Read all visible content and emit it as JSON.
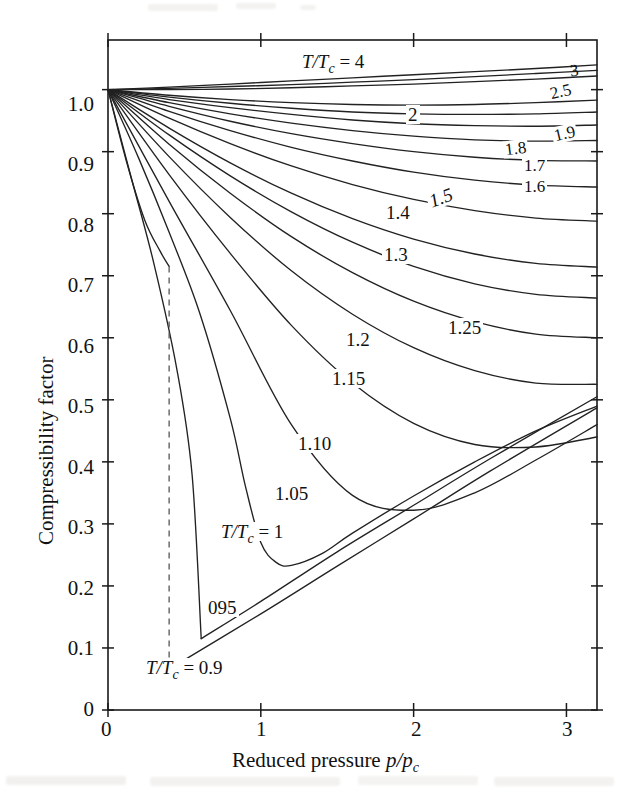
{
  "figure": {
    "kind": "generalized-compressibility-chart"
  },
  "axes": {
    "x": {
      "title_plain": "Reduced pressure ",
      "title_italic": "p/p",
      "title_sub": "c",
      "ticks": [
        "0",
        "1",
        "2",
        "3"
      ],
      "tick_values": [
        0,
        1,
        2,
        3
      ],
      "range": [
        0,
        3.2
      ]
    },
    "y": {
      "title": "Compressibility factor",
      "ticks": [
        "0",
        "0.1",
        "0.2",
        "0.3",
        "0.4",
        "0.5",
        "0.6",
        "0.7",
        "0.8",
        "0.9",
        "1.0"
      ],
      "tick_values": [
        0,
        0.1,
        0.2,
        0.3,
        0.4,
        0.5,
        0.6,
        0.7,
        0.8,
        0.9,
        1.0
      ],
      "range": [
        0,
        1.08
      ]
    }
  },
  "labels": {
    "tc4": {
      "plain_pre": "",
      "italic": "T/T",
      "sub": "c",
      "post": " = 4"
    },
    "tc1": {
      "italic": "T/T",
      "sub": "c",
      "post": " = 1"
    },
    "tc09": {
      "italic": "T/T",
      "sub": "c",
      "post": " = 0.9"
    },
    "tc095": "095",
    "c3": "3",
    "c25": "2.5",
    "c2": "2",
    "c19": "1.9",
    "c18": "1.8",
    "c17": "1.7",
    "c16": "1.6",
    "c15": "1.5",
    "c14": "1.4",
    "c13": "1.3",
    "c125": "1.25",
    "c12": "1.2",
    "c115": "1.15",
    "c110": "1.10",
    "c105": "1.05"
  },
  "colors": {
    "ink": "#1a1a1a",
    "curve": "#222222",
    "dashed": "#555555",
    "background": "#ffffff"
  },
  "chart_data": {
    "type": "line",
    "title": "",
    "xlabel": "Reduced pressure p/pc",
    "ylabel": "Compressibility factor",
    "xlim": [
      0,
      3.2
    ],
    "ylim": [
      0,
      1.08
    ],
    "grid": false,
    "legend": "inline-curve-labels",
    "x_ticks": [
      0,
      1,
      2,
      3
    ],
    "y_ticks": [
      0,
      0.1,
      0.2,
      0.3,
      0.4,
      0.5,
      0.6,
      0.7,
      0.8,
      0.9,
      1.0
    ],
    "series": [
      {
        "name": "T/Tc = 4",
        "label": "4",
        "x": [
          0,
          0.4,
          0.8,
          1.2,
          1.6,
          2.0,
          2.4,
          2.8,
          3.2
        ],
        "values": [
          1.0,
          1.004,
          1.009,
          1.014,
          1.019,
          1.024,
          1.029,
          1.034,
          1.04
        ]
      },
      {
        "name": "T/Tc = 3",
        "label": "3",
        "x": [
          0,
          0.4,
          0.8,
          1.2,
          1.6,
          2.0,
          2.4,
          2.8,
          3.2
        ],
        "values": [
          1.0,
          1.002,
          1.005,
          1.008,
          1.012,
          1.016,
          1.021,
          1.026,
          1.031
        ]
      },
      {
        "name": "T/Tc = 2.5",
        "label": "2.5",
        "x": [
          0,
          0.4,
          0.8,
          1.2,
          1.6,
          2.0,
          2.4,
          2.8,
          3.2
        ],
        "values": [
          1.0,
          1.0,
          1.001,
          1.003,
          1.006,
          1.009,
          1.013,
          1.017,
          1.022
        ]
      },
      {
        "name": "T/Tc = 2",
        "label": "2",
        "x": [
          0,
          0.4,
          0.8,
          1.2,
          1.6,
          2.0,
          2.4,
          2.8,
          3.2
        ],
        "values": [
          1.0,
          0.991,
          0.984,
          0.979,
          0.976,
          0.975,
          0.976,
          0.979,
          0.983
        ]
      },
      {
        "name": "T/Tc = 1.9",
        "label": "1.9",
        "x": [
          0,
          0.4,
          0.8,
          1.2,
          1.6,
          2.0,
          2.4,
          2.8,
          3.2
        ],
        "values": [
          1.0,
          0.988,
          0.978,
          0.97,
          0.964,
          0.961,
          0.96,
          0.961,
          0.964
        ]
      },
      {
        "name": "T/Tc = 1.8",
        "label": "1.8",
        "x": [
          0,
          0.4,
          0.8,
          1.2,
          1.6,
          2.0,
          2.4,
          2.8,
          3.2
        ],
        "values": [
          1.0,
          0.984,
          0.971,
          0.96,
          0.951,
          0.945,
          0.942,
          0.941,
          0.943
        ]
      },
      {
        "name": "T/Tc = 1.7",
        "label": "1.7",
        "x": [
          0,
          0.4,
          0.8,
          1.2,
          1.6,
          2.0,
          2.4,
          2.8,
          3.2
        ],
        "values": [
          1.0,
          0.979,
          0.961,
          0.946,
          0.934,
          0.925,
          0.919,
          0.917,
          0.918
        ]
      },
      {
        "name": "T/Tc = 1.6",
        "label": "1.6",
        "x": [
          0,
          0.4,
          0.8,
          1.2,
          1.6,
          2.0,
          2.4,
          2.8,
          3.2
        ],
        "values": [
          1.0,
          0.973,
          0.949,
          0.929,
          0.913,
          0.9,
          0.891,
          0.886,
          0.885
        ]
      },
      {
        "name": "T/Tc = 1.5",
        "label": "1.5",
        "x": [
          0,
          0.4,
          0.8,
          1.2,
          1.6,
          2.0,
          2.4,
          2.8,
          3.2
        ],
        "values": [
          1.0,
          0.965,
          0.934,
          0.907,
          0.885,
          0.867,
          0.854,
          0.846,
          0.843
        ]
      },
      {
        "name": "T/Tc = 1.4",
        "label": "1.4",
        "x": [
          0,
          0.4,
          0.8,
          1.2,
          1.6,
          2.0,
          2.4,
          2.8,
          3.2
        ],
        "values": [
          1.0,
          0.954,
          0.913,
          0.877,
          0.847,
          0.823,
          0.805,
          0.793,
          0.788
        ]
      },
      {
        "name": "T/Tc = 1.3",
        "label": "1.3",
        "x": [
          0,
          0.4,
          0.8,
          1.2,
          1.6,
          2.0,
          2.4,
          2.8,
          3.2
        ],
        "values": [
          1.0,
          0.938,
          0.882,
          0.833,
          0.792,
          0.759,
          0.735,
          0.72,
          0.714
        ]
      },
      {
        "name": "T/Tc = 1.25",
        "label": "1.25",
        "x": [
          0,
          0.4,
          0.8,
          1.2,
          1.6,
          2.0,
          2.4,
          2.8,
          3.2
        ],
        "values": [
          1.0,
          0.927,
          0.861,
          0.803,
          0.754,
          0.715,
          0.687,
          0.67,
          0.664
        ]
      },
      {
        "name": "T/Tc = 1.2",
        "label": "1.2",
        "x": [
          0,
          0.4,
          0.8,
          1.2,
          1.6,
          2.0,
          2.4,
          2.8,
          3.2
        ],
        "values": [
          1.0,
          0.912,
          0.833,
          0.763,
          0.705,
          0.659,
          0.626,
          0.606,
          0.6
        ]
      },
      {
        "name": "T/Tc = 1.15",
        "label": "1.15",
        "x": [
          0,
          0.4,
          0.8,
          1.2,
          1.6,
          2.0,
          2.4,
          2.8,
          3.2
        ],
        "values": [
          1.0,
          0.892,
          0.794,
          0.708,
          0.638,
          0.584,
          0.547,
          0.527,
          0.525
        ]
      },
      {
        "name": "T/Tc = 1.10",
        "label": "1.10",
        "x": [
          0,
          0.4,
          0.8,
          1.2,
          1.6,
          2.0,
          2.4,
          2.8,
          3.2
        ],
        "values": [
          1.0,
          0.863,
          0.736,
          0.62,
          0.527,
          0.462,
          0.428,
          0.424,
          0.44
        ]
      },
      {
        "name": "T/Tc = 1.05",
        "label": "1.05",
        "x": [
          0,
          0.4,
          0.8,
          1.2,
          1.6,
          2.0,
          2.4,
          2.8,
          3.2
        ],
        "values": [
          1.0,
          0.82,
          0.644,
          0.46,
          0.346,
          0.322,
          0.35,
          0.403,
          0.46
        ]
      },
      {
        "name": "T/Tc = 1",
        "label": "1",
        "x": [
          0,
          0.2,
          0.4,
          0.6,
          0.8,
          0.9,
          1.0,
          1.1,
          1.2,
          1.4,
          1.6,
          2.0,
          2.4,
          2.8,
          3.2
        ],
        "values": [
          1.0,
          0.89,
          0.77,
          0.64,
          0.47,
          0.36,
          0.27,
          0.238,
          0.233,
          0.252,
          0.285,
          0.345,
          0.4,
          0.45,
          0.49
        ]
      },
      {
        "name": "T/Tc = 0.95 (saturated vapour / liquid branches, vertical dashed transition)",
        "label": "095",
        "vapour_branch": {
          "x": [
            0,
            0.15,
            0.3,
            0.45,
            0.55,
            0.61
          ],
          "values": [
            1.0,
            0.86,
            0.72,
            0.55,
            0.38,
            0.115
          ]
        },
        "saturation_pressure": 0.61,
        "liquid_branch": {
          "x": [
            0.61,
            1.0,
            1.5,
            2.0,
            2.5,
            3.2
          ],
          "values": [
            0.115,
            0.175,
            0.255,
            0.33,
            0.405,
            0.505
          ]
        }
      },
      {
        "name": "T/Tc = 0.9 (saturated vapour / liquid branches, vertical dashed transition)",
        "label": "0.9",
        "vapour_branch": {
          "x": [
            0,
            0.12,
            0.24,
            0.34,
            0.4
          ],
          "values": [
            1.0,
            0.885,
            0.79,
            0.74,
            0.715
          ]
        },
        "saturation_pressure": 0.4,
        "liquid_branch": {
          "x": [
            0.4,
            1.0,
            1.5,
            2.0,
            2.5,
            3.2
          ],
          "values": [
            0.066,
            0.155,
            0.232,
            0.308,
            0.385,
            0.487
          ]
        }
      }
    ]
  }
}
